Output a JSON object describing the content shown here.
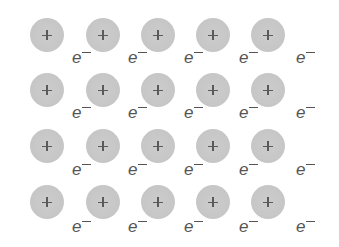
{
  "diagram": {
    "ion_label": "+",
    "electron_label": "e",
    "electron_charge": "−",
    "colors": {
      "ion_fill": "#c8c8c8",
      "ion_sign": "#5a5a5a",
      "electron_text": "#555555",
      "background": "#ffffff"
    },
    "ion_rows": 4,
    "ion_cols": 5,
    "electrons_per_row": 5,
    "ion_centers": {
      "x": [
        47,
        103,
        158,
        213,
        268
      ],
      "y": [
        35,
        90,
        146,
        202
      ]
    },
    "electron_positions": {
      "x": [
        72,
        128,
        184,
        239,
        296
      ],
      "baseline_y": [
        63,
        118,
        175,
        232
      ]
    }
  }
}
